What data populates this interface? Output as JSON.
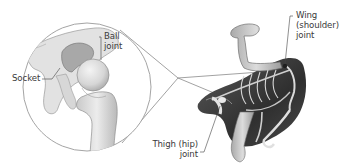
{
  "diagram": {
    "inset": {
      "description": "Magnified view of hip ball-and-socket joint",
      "labels": {
        "ball_joint": [
          "Ball",
          "joint"
        ],
        "socket": "Socket"
      }
    },
    "main": {
      "description": "Bird body silhouette with skeleton",
      "labels": {
        "wing_joint": [
          "Wing",
          "(shoulder)",
          "joint"
        ],
        "thigh_joint": [
          "Thigh (hip)",
          "joint"
        ]
      }
    },
    "colors": {
      "bone_light": "#e4e4e4",
      "bone_mid": "#bdbdbd",
      "bone_dark": "#8a8a8a",
      "body_dark": "#3b3b3b",
      "body_mid": "#6a6a6a",
      "line": "#777777",
      "text": "#3a3a3a"
    }
  }
}
